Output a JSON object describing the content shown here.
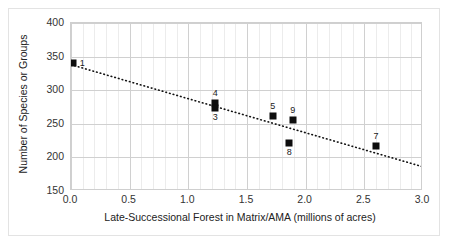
{
  "chart_data": {
    "type": "scatter",
    "title": "",
    "xlabel": "Late-Successional Forest in Matrix/AMA (millions of acres)",
    "ylabel": "Number of Species or Groups",
    "xlim": [
      0.0,
      3.0
    ],
    "ylim": [
      150,
      400
    ],
    "xticks": [
      "0.0",
      "0.5",
      "1.0",
      "1.5",
      "2.0",
      "2.5",
      "3.0"
    ],
    "xtick_values": [
      0.0,
      0.5,
      1.0,
      1.5,
      2.0,
      2.5,
      3.0
    ],
    "yticks": [
      "400",
      "350",
      "300",
      "250",
      "200",
      "150"
    ],
    "ytick_values": [
      400,
      350,
      300,
      250,
      200,
      150
    ],
    "grid": true,
    "minor_x_gridlines": true,
    "minor_x_step": 0.1,
    "legend": "none",
    "marker_color": "#0d0d0d",
    "grid_color": "#d0d0d0",
    "minor_grid_color": "#ececec",
    "trendline": {
      "style": "dotted",
      "color": "#111111",
      "x_start": 0.0,
      "y_start": 338,
      "x_end": 3.0,
      "y_end": 186
    },
    "points": [
      {
        "label": "1",
        "x": 0.02,
        "y": 341,
        "label_dx": 9,
        "label_dy": -4
      },
      {
        "label": "4",
        "x": 1.23,
        "y": 281,
        "label_dx": 0,
        "label_dy": -14
      },
      {
        "label": "3",
        "x": 1.23,
        "y": 274,
        "label_dx": 0,
        "label_dy": 5
      },
      {
        "label": "5",
        "x": 1.72,
        "y": 262,
        "label_dx": 0,
        "label_dy": -14
      },
      {
        "label": "9",
        "x": 1.89,
        "y": 255,
        "label_dx": 0,
        "label_dy": -14
      },
      {
        "label": "8",
        "x": 1.86,
        "y": 222,
        "label_dx": 0,
        "label_dy": 5
      },
      {
        "label": "7",
        "x": 2.6,
        "y": 217,
        "label_dx": 0,
        "label_dy": -14
      }
    ]
  }
}
